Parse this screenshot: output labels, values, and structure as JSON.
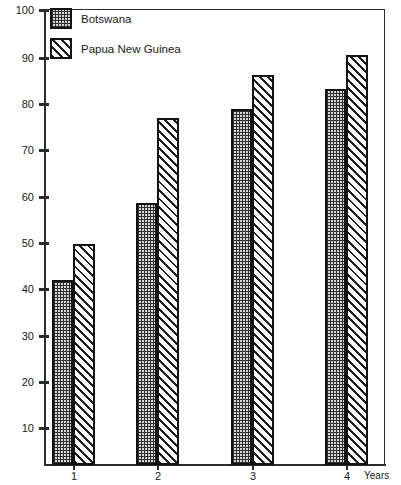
{
  "top_caption": "",
  "legend": {
    "position": "top-left-inside",
    "items": [
      {
        "label": "Botswana",
        "pattern": "dotted",
        "swatch_name": "legend-swatch-botswana"
      },
      {
        "label": "Papua New Guinea",
        "pattern": "hatched",
        "swatch_name": "legend-swatch-papua-new-guinea"
      }
    ]
  },
  "axes": {
    "y_ticks": [
      "100",
      "90",
      "80",
      "70",
      "60",
      "50",
      "40",
      "30",
      "20",
      "10"
    ],
    "x_ticks": [
      "1",
      "2",
      "3",
      "4"
    ],
    "x_title": "Years"
  },
  "chart_data": {
    "type": "bar",
    "title": "",
    "xlabel": "Years",
    "ylabel": "",
    "categories": [
      "1",
      "2",
      "3",
      "4"
    ],
    "series": [
      {
        "name": "Botswana",
        "pattern": "dotted",
        "values": [
          40.5,
          57.5,
          78.0,
          82.5
        ]
      },
      {
        "name": "Papua New Guinea",
        "pattern": "hatched",
        "values": [
          48.5,
          76.0,
          85.5,
          90.0
        ]
      }
    ],
    "ylim": [
      0,
      100
    ],
    "ytick_step": 10,
    "grid": false,
    "legend_position": "top-left-inside",
    "bar_style": "paired-grouped-outlined"
  }
}
